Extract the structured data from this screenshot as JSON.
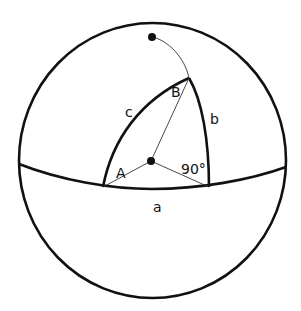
{
  "diagram": {
    "type": "spherical-triangle",
    "colors": {
      "stroke": "#111111",
      "background": "#ffffff"
    },
    "sphere": {
      "cx": 152,
      "cy": 161,
      "r": 134
    },
    "center_point": {
      "x": 151,
      "y": 161
    },
    "pole_point": {
      "x": 152,
      "y": 37
    },
    "vertices": {
      "A": {
        "x": 103,
        "y": 187
      },
      "B": {
        "x": 189,
        "y": 78
      },
      "C": {
        "x": 209,
        "y": 187
      }
    },
    "labels": {
      "side_a": "a",
      "side_b": "b",
      "side_c": "c",
      "angle_A": "A",
      "angle_B": "B",
      "angle_C": "90°"
    }
  }
}
